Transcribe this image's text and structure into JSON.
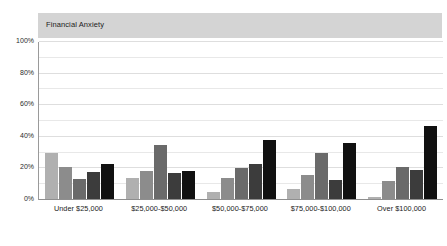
{
  "chart_data": {
    "type": "bar",
    "title": "Financial Anxiety",
    "xlabel": "",
    "ylabel": "",
    "ylim": [
      0,
      100
    ],
    "yticks": [
      "0%",
      "20%",
      "40%",
      "60%",
      "80%",
      "100%"
    ],
    "ytick_values": [
      0,
      20,
      40,
      60,
      80,
      100
    ],
    "grid": true,
    "grid_minor_step": 10,
    "legend": "none",
    "categories": [
      "Under $25,000",
      "$25,000-$50,000",
      "$50,000-$75,000",
      "$75,000-$100,000",
      "Over $100,000"
    ],
    "series": [
      {
        "name": "series-1",
        "color": "#b0b0b0",
        "values": [
          30,
          14,
          5,
          7,
          2
        ]
      },
      {
        "name": "series-2",
        "color": "#8c8c8c",
        "values": [
          21,
          18.5,
          14,
          16,
          12
        ]
      },
      {
        "name": "series-3",
        "color": "#6a6a6a",
        "values": [
          13,
          35,
          20.5,
          30,
          21
        ]
      },
      {
        "name": "series-4",
        "color": "#3c3c3c",
        "values": [
          18,
          17,
          23,
          12.5,
          19
        ]
      },
      {
        "name": "series-5",
        "color": "#111111",
        "values": [
          22.5,
          18.5,
          38,
          36,
          47
        ]
      }
    ]
  },
  "style": {
    "title_band_color": "#d4d4d4",
    "plot_background": "#ffffff",
    "gridline_color": "#e8e8e8",
    "axis_color": "#8f8f8f",
    "text_color": "#1b1b1b"
  }
}
